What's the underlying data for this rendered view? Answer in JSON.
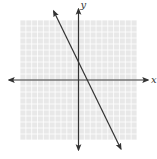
{
  "chart_data": {
    "type": "line",
    "title": "",
    "xlabel": "x",
    "ylabel": "y",
    "xlim": [
      -10,
      10
    ],
    "ylim": [
      -10,
      10
    ],
    "grid": true,
    "grid_step": 1,
    "series": [
      {
        "name": "line",
        "equation": "y = -2x + 3",
        "slope": -2,
        "intercept": 3,
        "x": [
          -3.5,
          8.5
        ],
        "y": [
          10,
          -14
        ]
      }
    ]
  },
  "colors": {
    "grid_background": "#e8e8e8",
    "grid_lines": "#ffffff",
    "axes": "#333333",
    "series_line": "#333333"
  }
}
